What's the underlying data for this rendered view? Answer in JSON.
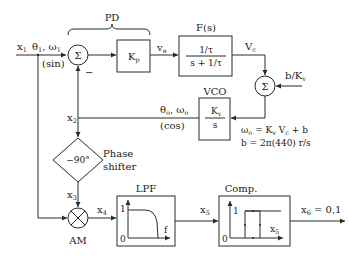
{
  "diagram": {
    "type": "block-diagram",
    "blocks": {
      "pd": {
        "label": "PD"
      },
      "sum1": {
        "symbol": "Σ",
        "minus_sign": "−"
      },
      "kp": {
        "label": "K",
        "sub": "p"
      },
      "fs": {
        "label": "F(s)",
        "num": "1/τ",
        "den": "s + 1/τ"
      },
      "sum2": {
        "symbol": "Σ"
      },
      "vco": {
        "label": "VCO",
        "num": "K",
        "num_sub": "v",
        "den": "s"
      },
      "phase_shifter": {
        "value": "−90°",
        "label_line1": "Phase",
        "label_line2": "shifter"
      },
      "am": {
        "symbol": "×",
        "label": "AM"
      },
      "lpf": {
        "label": "LPF",
        "y1": "1",
        "y0": "0",
        "xaxis": "f"
      },
      "comp": {
        "label": "Comp.",
        "y1": "1",
        "y0": "0",
        "xaxis": "x",
        "xaxis_sub": "5"
      }
    },
    "signals": {
      "x1": {
        "name": "x",
        "sub": "1",
        "desc": "θ",
        "desc_sub": "1",
        "desc2": ", ω",
        "desc2_sub": "1",
        "wave": "(sin)"
      },
      "ve": {
        "name": "v",
        "sub": "e"
      },
      "vc": {
        "name": "V",
        "sub": "c"
      },
      "bkv": {
        "text": "b/K",
        "sub": "v"
      },
      "theta_o": {
        "text": "θ",
        "sub": "o",
        "text2": ", ω",
        "sub2": "o",
        "wave": "(cos)"
      },
      "x2": {
        "name": "x",
        "sub": "2"
      },
      "x3": {
        "name": "x",
        "sub": "3"
      },
      "x4": {
        "name": "x",
        "sub": "4"
      },
      "x5": {
        "name": "x",
        "sub": "5"
      },
      "x6": {
        "name": "x",
        "sub": "6",
        "value": " = 0,1"
      }
    },
    "equations": {
      "eq1": {
        "a": "ω",
        "a_sub": "o",
        "b": " = K",
        "b_sub": "v",
        "c": " V",
        "c_sub": "c",
        "d": " + b"
      },
      "eq2": "b = 2π(440) r/s"
    }
  }
}
